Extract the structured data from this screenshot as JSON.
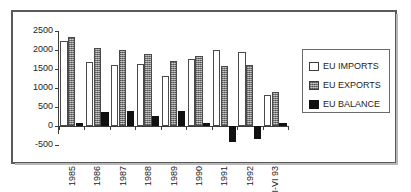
{
  "chart_data": {
    "type": "bar",
    "title": "",
    "subtitle": "",
    "xlabel": "",
    "ylabel": "",
    "categories": [
      "1985",
      "1986",
      "1987",
      "1988",
      "1989",
      "1990",
      "1991",
      "1992",
      "I-VI 93"
    ],
    "series": [
      {
        "name": "EU IMPORTS",
        "color": "#ffffff",
        "values": [
          2250,
          1680,
          1600,
          1630,
          1320,
          1770,
          2000,
          1950,
          810
        ]
      },
      {
        "name": "EU EXPORTS",
        "color": "#9a9a9a",
        "values": [
          2330,
          2050,
          2000,
          1890,
          1700,
          1850,
          1590,
          1610,
          900
        ]
      },
      {
        "name": "EU BALANCE",
        "color": "#111111",
        "values": [
          80,
          370,
          400,
          270,
          385,
          80,
          -410,
          -340,
          90
        ]
      }
    ],
    "ylim": [
      -500,
      2500
    ],
    "yticks": [
      2500,
      2000,
      1500,
      1000,
      500,
      0,
      -500
    ],
    "ytick_labels": [
      "2500",
      "2000",
      "1500",
      "1000",
      "500",
      "0",
      "-500"
    ],
    "grid": false,
    "legend_position": "right"
  },
  "legend": {
    "entries": [
      {
        "label": "EU IMPORTS",
        "swatch": "imports"
      },
      {
        "label": "EU EXPORTS",
        "swatch": "exports"
      },
      {
        "label": "EU BALANCE",
        "swatch": "balance"
      }
    ]
  }
}
